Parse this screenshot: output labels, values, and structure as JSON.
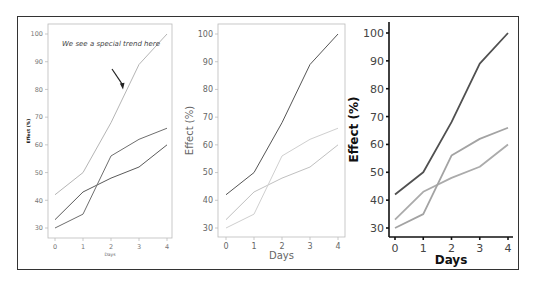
{
  "chart_data": [
    {
      "type": "line",
      "panel": "left",
      "title": "",
      "xlabel": "Days",
      "ylabel": "Effect (%)",
      "x": [
        0,
        1,
        2,
        3,
        4
      ],
      "xticks": [
        "0",
        "1",
        "2",
        "3",
        "4"
      ],
      "yticks": [
        "30",
        "40",
        "50",
        "60",
        "70",
        "80",
        "90",
        "100"
      ],
      "ylim": [
        27,
        103
      ],
      "annotation": {
        "text": "We see a special trend here",
        "arrow_to": [
          2.5,
          80
        ]
      },
      "series": [
        {
          "name": "A",
          "values": [
            42,
            50,
            68,
            89,
            100
          ],
          "color": "#b5b5b5"
        },
        {
          "name": "B",
          "values": [
            33,
            43,
            48,
            52,
            60
          ],
          "color": "#5a5a5a"
        },
        {
          "name": "C",
          "values": [
            30,
            35,
            56,
            62,
            66
          ],
          "color": "#6e6e6e"
        }
      ]
    },
    {
      "type": "line",
      "panel": "middle",
      "title": "",
      "xlabel": "Days",
      "ylabel": "Effect (%)",
      "x": [
        0,
        1,
        2,
        3,
        4
      ],
      "xticks": [
        "0",
        "1",
        "2",
        "3",
        "4"
      ],
      "yticks": [
        "30",
        "40",
        "50",
        "60",
        "70",
        "80",
        "90",
        "100"
      ],
      "ylim": [
        27,
        103
      ],
      "series": [
        {
          "name": "A",
          "values": [
            42,
            50,
            68,
            89,
            100
          ],
          "color": "#555555"
        },
        {
          "name": "B",
          "values": [
            33,
            43,
            48,
            52,
            60
          ],
          "color": "#c0c0c0"
        },
        {
          "name": "C",
          "values": [
            30,
            35,
            56,
            62,
            66
          ],
          "color": "#cfcfcf"
        }
      ]
    },
    {
      "type": "line",
      "panel": "right",
      "title": "",
      "xlabel": "Days",
      "ylabel": "Effect (%)",
      "x": [
        0,
        1,
        2,
        3,
        4
      ],
      "xticks": [
        "0",
        "1",
        "2",
        "3",
        "4"
      ],
      "yticks": [
        "30",
        "40",
        "50",
        "60",
        "70",
        "80",
        "90",
        "100"
      ],
      "ylim": [
        27,
        103
      ],
      "series": [
        {
          "name": "A",
          "values": [
            42,
            50,
            68,
            89,
            100
          ],
          "color": "#505050"
        },
        {
          "name": "B",
          "values": [
            33,
            43,
            48,
            52,
            60
          ],
          "color": "#ababab"
        },
        {
          "name": "C",
          "values": [
            30,
            35,
            56,
            62,
            66
          ],
          "color": "#a3a3a3"
        }
      ]
    }
  ]
}
